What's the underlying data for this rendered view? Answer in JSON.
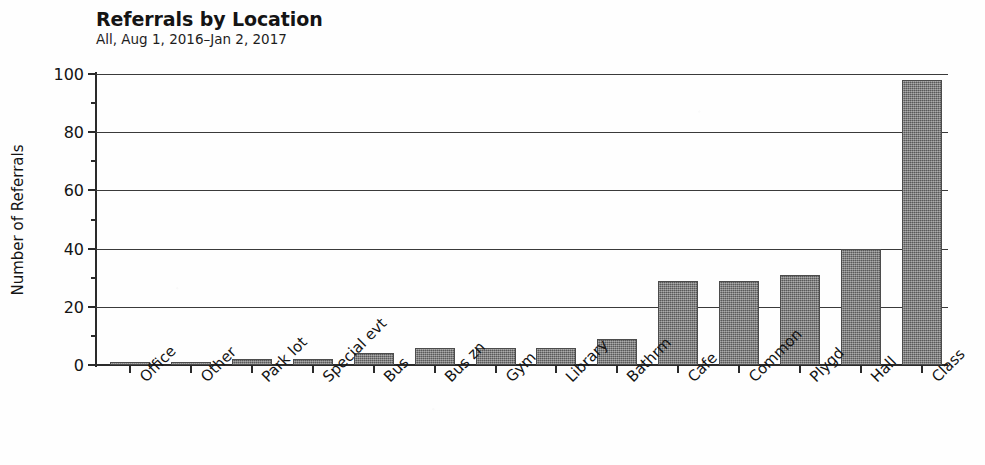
{
  "chart_data": {
    "type": "bar",
    "title": "Referrals by Location",
    "subtitle": "All, Aug 1, 2016–Jan 2, 2017",
    "xlabel": "",
    "ylabel": "Number of Referrals",
    "ylim": [
      0,
      100
    ],
    "ytick_labels": [
      "0",
      "20",
      "40",
      "60",
      "80",
      "100"
    ],
    "ytick_values": [
      0,
      20,
      40,
      60,
      80,
      100
    ],
    "yminor_interval": 10,
    "grid": "horizontal",
    "legend": "none",
    "bar_color": "#6d6d6d",
    "categories": [
      "Office",
      "Other",
      "Park lot",
      "Special evt",
      "Bus",
      "Bus zn",
      "Gym",
      "Library",
      "Bathrm",
      "Cafe",
      "Common",
      "Plygd",
      "Hall",
      "Class"
    ],
    "values": [
      1,
      1,
      2,
      2,
      4,
      6,
      6,
      6,
      9,
      29,
      29,
      31,
      40,
      98
    ]
  }
}
